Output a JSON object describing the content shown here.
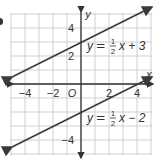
{
  "chart_data": {
    "type": "line",
    "title": "",
    "xlabel": "x",
    "ylabel": "y",
    "xlim": [
      -5,
      5
    ],
    "ylim": [
      -5,
      5
    ],
    "grid": true,
    "x_ticks": [
      -4,
      -2,
      2,
      4
    ],
    "y_ticks": [
      4,
      2,
      -4
    ],
    "origin_label": "O",
    "series": [
      {
        "name": "y = 1/2 x + 3",
        "slope": 0.5,
        "intercept": 3,
        "x": [
          -5,
          5
        ],
        "y": [
          0.5,
          5.5
        ],
        "label_lhs": "y = ",
        "label_num": "1",
        "label_den": "2",
        "label_rhs": "x + 3"
      },
      {
        "name": "y = 1/2 x − 2",
        "slope": 0.5,
        "intercept": -2,
        "x": [
          -5,
          5
        ],
        "y": [
          -4.5,
          0.5
        ],
        "label_lhs": "y = ",
        "label_num": "1",
        "label_den": "2",
        "label_rhs": "x − 2"
      }
    ],
    "line_color": "#3a3a3a",
    "grid_color": "#cfcfcf",
    "axis_color": "#333333"
  }
}
